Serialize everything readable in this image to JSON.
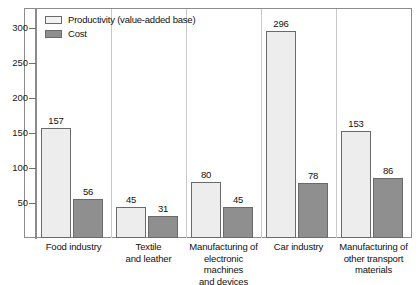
{
  "chart_data": {
    "type": "bar",
    "title": "",
    "xlabel": "",
    "ylabel": "",
    "ylim": [
      0,
      320
    ],
    "yticks": [
      50,
      100,
      150,
      200,
      250,
      300
    ],
    "grid": false,
    "legend_position": "top-left",
    "categories": [
      "Food industry",
      "Textile\nand leather",
      "Manufacturing of\nelectronic machines\nand devices",
      "Car industry",
      "Manufacturing of\nother transport\nmaterials"
    ],
    "category_lines": [
      [
        "Food industry"
      ],
      [
        "Textile",
        "and leather"
      ],
      [
        "Manufacturing of",
        "electronic machines",
        "and devices"
      ],
      [
        "Car industry"
      ],
      [
        "Manufacturing of",
        "other transport",
        "materials"
      ]
    ],
    "series": [
      {
        "name": "Productivity (value-added base)",
        "color": "#ededed",
        "values": [
          157,
          45,
          80,
          296,
          153
        ]
      },
      {
        "name": "Cost",
        "color": "#8f8f8f",
        "values": [
          56,
          31,
          45,
          78,
          86
        ]
      }
    ]
  },
  "legend": {
    "items": [
      {
        "label": "Productivity (value-added base)",
        "swatch": "light-gray"
      },
      {
        "label": "Cost",
        "swatch": "dark-gray"
      }
    ]
  },
  "axis": {
    "y_tick_labels": [
      "300",
      "250",
      "200",
      "150",
      "100",
      "50"
    ]
  }
}
